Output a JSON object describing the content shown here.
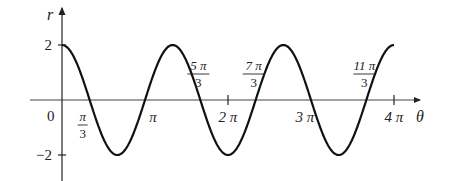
{
  "chart_data": {
    "type": "line",
    "title": "",
    "xlabel": "θ",
    "ylabel": "r",
    "function": "r = 2 cos(3θ/2)",
    "xlim_radians_over_pi": [
      0,
      4
    ],
    "ylim": [
      -2,
      2
    ],
    "grid": false,
    "legend": null,
    "y_ticks": [
      {
        "value": 2,
        "label": "2"
      },
      {
        "value": -2,
        "label": "−2"
      }
    ],
    "x_ticks": [
      {
        "value_pi": 1,
        "label": "π"
      },
      {
        "value_pi": 2,
        "label": "2 π"
      },
      {
        "value_pi": 3,
        "label": "3 π"
      },
      {
        "value_pi": 4,
        "label": "4 π"
      }
    ],
    "origin_label": "0",
    "annotations": [
      {
        "value_pi": 0.3333,
        "num": "π",
        "den": "3",
        "position": "below"
      },
      {
        "value_pi": 1.6667,
        "num": "5 π",
        "den": "3",
        "position": "above"
      },
      {
        "value_pi": 2.3333,
        "num": "7 π",
        "den": "3",
        "position": "above"
      },
      {
        "value_pi": 3.6667,
        "num": "11 π",
        "den": "3",
        "position": "above"
      }
    ],
    "series": [
      {
        "name": "r(θ)",
        "x_over_pi": [
          0,
          0.3333,
          0.6667,
          1,
          1.3333,
          1.6667,
          2,
          2.3333,
          2.6667,
          3,
          3.3333,
          3.6667,
          4
        ],
        "y": [
          2,
          0,
          -2,
          0,
          2,
          0,
          -2,
          0,
          2,
          0,
          -2,
          0,
          2
        ]
      }
    ]
  },
  "axes": {
    "x_label": "θ",
    "y_label": "r"
  }
}
